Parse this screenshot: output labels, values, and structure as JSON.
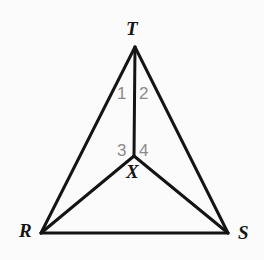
{
  "figure": {
    "type": "geometry-diagram",
    "background_color": "#fbfbfb",
    "stroke_color": "#141414",
    "label_color": "#141414",
    "angle_label_color": "#8a8a8a",
    "canvas": {
      "width": 264,
      "height": 260
    },
    "points": {
      "T": {
        "label": "T",
        "x": 135,
        "y": 47
      },
      "R": {
        "label": "R",
        "x": 41,
        "y": 233
      },
      "S": {
        "label": "S",
        "x": 228,
        "y": 233
      },
      "X": {
        "label": "X",
        "x": 134,
        "y": 156
      }
    },
    "segments": [
      {
        "name": "TR",
        "from": "T",
        "to": "R"
      },
      {
        "name": "TS",
        "from": "T",
        "to": "S"
      },
      {
        "name": "RS",
        "from": "R",
        "to": "S"
      },
      {
        "name": "TX",
        "from": "T",
        "to": "X"
      },
      {
        "name": "XR",
        "from": "X",
        "to": "R"
      },
      {
        "name": "XS",
        "from": "X",
        "to": "S"
      }
    ],
    "angle_labels": [
      {
        "name": "angle-1",
        "label": "1"
      },
      {
        "name": "angle-2",
        "label": "2"
      },
      {
        "name": "angle-3",
        "label": "3"
      },
      {
        "name": "angle-4",
        "label": "4"
      }
    ]
  }
}
